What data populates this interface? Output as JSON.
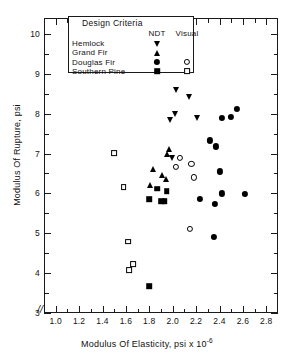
{
  "chart_data": {
    "type": "scatter",
    "title": "",
    "xlabel": "Modulus Of Elasticity, psi x 10",
    "xlabel_exponent": "-6",
    "ylabel": "Modulus Of Rupture, psi",
    "xlim": [
      0.9,
      2.9
    ],
    "ylim": [
      3,
      10.4
    ],
    "xticks": [
      "1.0",
      "1.2",
      "1.4",
      "1.6",
      "1.8",
      "2.0",
      "2.2",
      "2.4",
      "2.6",
      "2.8"
    ],
    "xtick_values": [
      1.0,
      1.2,
      1.4,
      1.6,
      1.8,
      2.0,
      2.2,
      2.4,
      2.6,
      2.8
    ],
    "xminor_step": 0.1,
    "yticks": [
      "3",
      "4",
      "5",
      "6",
      "7",
      "8",
      "9",
      "10"
    ],
    "ytick_values": [
      3,
      4,
      5,
      6,
      7,
      8,
      9,
      10
    ],
    "yminor_step": 0.5,
    "grid": false,
    "axis_break": "//",
    "legend_position": "top-center",
    "series": [
      {
        "name": "Hemlock",
        "criteria": "NDT",
        "marker": "tri-down",
        "points": [
          [
            2.03,
            8.6
          ],
          [
            2.14,
            8.43
          ],
          [
            2.02,
            8.0
          ],
          [
            1.98,
            7.85
          ],
          [
            2.21,
            7.9
          ],
          [
            1.99,
            6.88
          ]
        ]
      },
      {
        "name": "Grand Fir",
        "criteria": "NDT",
        "marker": "tri-up",
        "points": [
          [
            1.97,
            7.12
          ],
          [
            1.95,
            7.0
          ],
          [
            1.83,
            6.6
          ],
          [
            1.91,
            6.45
          ],
          [
            1.94,
            6.35
          ],
          [
            1.81,
            6.22
          ]
        ]
      },
      {
        "name": "Douglas Fir",
        "criteria": "NDT",
        "marker": "circle-filled",
        "points": [
          [
            2.55,
            8.12
          ],
          [
            2.5,
            7.92
          ],
          [
            2.42,
            7.9
          ],
          [
            2.32,
            7.33
          ],
          [
            2.37,
            7.18
          ],
          [
            2.4,
            6.55
          ],
          [
            2.23,
            5.87
          ],
          [
            2.42,
            6.0
          ],
          [
            2.36,
            5.73
          ],
          [
            2.62,
            5.98
          ],
          [
            2.35,
            4.9
          ]
        ]
      },
      {
        "name": "Douglas Fir",
        "criteria": "Visual",
        "marker": "circle-open",
        "points": [
          [
            2.06,
            6.9
          ],
          [
            2.03,
            6.67
          ],
          [
            2.16,
            6.73
          ],
          [
            2.18,
            6.4
          ],
          [
            2.15,
            5.1
          ]
        ]
      },
      {
        "name": "Southern Pine",
        "criteria": "NDT",
        "marker": "square-filled",
        "points": [
          [
            1.95,
            6.06
          ],
          [
            1.87,
            6.12
          ],
          [
            1.8,
            5.85
          ],
          [
            1.9,
            5.8
          ],
          [
            1.93,
            5.8
          ],
          [
            1.8,
            3.67
          ]
        ]
      },
      {
        "name": "Southern Pine",
        "criteria": "Visual",
        "marker": "square-open",
        "points": [
          [
            1.5,
            7.02
          ],
          [
            1.58,
            6.16
          ],
          [
            1.62,
            4.79
          ],
          [
            1.66,
            4.22
          ],
          [
            1.63,
            4.08
          ]
        ]
      }
    ]
  },
  "legend": {
    "title": "Design Criteria",
    "columns": [
      "NDT",
      "Visual"
    ],
    "rows": [
      {
        "label": "Hemlock",
        "ndt": "tri-down",
        "visual": ""
      },
      {
        "label": "Grand Fir",
        "ndt": "tri-up",
        "visual": ""
      },
      {
        "label": "Douglas Fir",
        "ndt": "circle-filled",
        "visual": "circle-open"
      },
      {
        "label": "Southern Pine",
        "ndt": "square-filled",
        "visual": "square-open"
      }
    ]
  },
  "colors": {
    "marker": "#000000",
    "axis": "#1a1a1a",
    "background": "#ffffff"
  }
}
